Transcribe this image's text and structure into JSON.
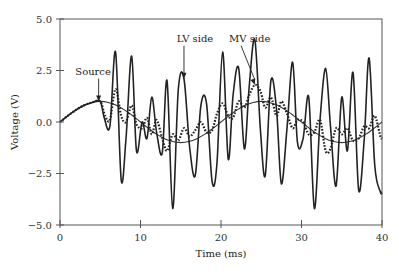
{
  "chart_data": {
    "type": "line",
    "title": "",
    "xlabel": "Time (ms)",
    "ylabel": "Voltage (V)",
    "xlim": [
      0,
      40
    ],
    "ylim": [
      -5.0,
      5.0
    ],
    "xticks": [
      0,
      10,
      20,
      30,
      40
    ],
    "xtick_labels": [
      "0",
      "10",
      "20",
      "30",
      "40"
    ],
    "yticks": [
      5.0,
      2.5,
      0.0,
      -2.5,
      -5.0
    ],
    "ytick_labels": [
      "5.0",
      "2.5",
      "0.0",
      "−2.5",
      "−5.0"
    ],
    "grid": false,
    "legend": "none (inline annotations)",
    "annotations": [
      {
        "text": "Source",
        "x_text": 1.9,
        "y_text": 2.3,
        "arrow_to": [
          4.8,
          1.0
        ]
      },
      {
        "text": "LV side",
        "x_text": 14.5,
        "y_text": 3.9,
        "arrow_to": [
          15.4,
          2.1
        ]
      },
      {
        "text": "MV side",
        "x_text": 21.0,
        "y_text": 3.9,
        "arrow_to": [
          24.2,
          1.8
        ]
      }
    ],
    "series": [
      {
        "name": "Source",
        "style": "solid-thin",
        "x": [
          0,
          1,
          2,
          3,
          4,
          5,
          6,
          7,
          8,
          9,
          10,
          11,
          12,
          13,
          14,
          15,
          16,
          17,
          18,
          19,
          20,
          21,
          22,
          23,
          24,
          25,
          26,
          27,
          28,
          29,
          30,
          31,
          32,
          33,
          34,
          35,
          36,
          37,
          38,
          39,
          40
        ],
        "values": [
          0.0,
          0.31,
          0.59,
          0.81,
          0.95,
          1.0,
          0.95,
          0.81,
          0.59,
          0.31,
          0.0,
          -0.31,
          -0.59,
          -0.81,
          -0.95,
          -1.0,
          -0.95,
          -0.81,
          -0.59,
          -0.31,
          0.0,
          0.31,
          0.59,
          0.81,
          0.95,
          1.0,
          0.95,
          0.81,
          0.59,
          0.31,
          0.0,
          -0.31,
          -0.59,
          -0.81,
          -0.95,
          -1.0,
          -0.95,
          -0.81,
          -0.59,
          -0.31,
          0.0
        ]
      },
      {
        "name": "LV side",
        "style": "solid-thick",
        "x": [
          0,
          1,
          2,
          3,
          4,
          5,
          5.5,
          6.2,
          6.9,
          7.6,
          8.2,
          8.9,
          9.5,
          10.2,
          10.8,
          11.4,
          12.0,
          12.7,
          13.3,
          14.0,
          14.7,
          15.4,
          16.1,
          16.8,
          17.5,
          18.2,
          18.9,
          19.5,
          20.2,
          20.9,
          21.5,
          22.2,
          22.9,
          23.5,
          24.2,
          24.9,
          25.5,
          26.2,
          26.9,
          27.5,
          28.2,
          28.9,
          29.5,
          30.2,
          30.9,
          31.6,
          32.3,
          33.0,
          33.6,
          34.3,
          35.0,
          35.7,
          36.4,
          37.1,
          37.8,
          38.4,
          39.1,
          39.8,
          40
        ],
        "values": [
          0.0,
          0.31,
          0.59,
          0.81,
          0.95,
          1.0,
          0.2,
          -0.2,
          3.4,
          -2.8,
          -0.8,
          3.2,
          -1.4,
          0.0,
          -0.8,
          1.2,
          -0.5,
          -1.5,
          2.0,
          -4.2,
          1.6,
          2.1,
          -1.2,
          -2.6,
          0.8,
          0.9,
          -2.9,
          -2.0,
          3.4,
          -1.8,
          1.3,
          2.6,
          -1.3,
          1.7,
          4.0,
          -0.4,
          -2.6,
          2.0,
          0.6,
          -3.0,
          -0.3,
          2.9,
          -1.0,
          -0.8,
          1.2,
          -4.2,
          0.1,
          2.6,
          -0.2,
          -3.1,
          1.2,
          -1.4,
          2.4,
          -3.3,
          -0.8,
          3.1,
          -2.1,
          -3.4,
          -3.4
        ]
      },
      {
        "name": "MV side",
        "style": "dotted",
        "x": [
          0,
          1,
          2,
          3,
          4,
          5,
          5.6,
          6.2,
          6.9,
          7.6,
          8.2,
          8.9,
          9.5,
          10.2,
          10.8,
          11.4,
          12.0,
          12.7,
          13.3,
          14.0,
          14.7,
          15.4,
          16.1,
          16.8,
          17.5,
          18.2,
          18.9,
          19.5,
          20.2,
          20.9,
          21.5,
          22.2,
          22.9,
          23.5,
          24.2,
          24.9,
          25.5,
          26.2,
          26.9,
          27.5,
          28.2,
          28.9,
          29.5,
          30.2,
          30.9,
          31.6,
          32.3,
          33.0,
          33.6,
          34.3,
          35.0,
          35.7,
          36.4,
          37.1,
          37.8,
          38.4,
          39.1,
          39.8,
          40
        ],
        "values": [
          0.0,
          0.31,
          0.59,
          0.81,
          0.95,
          1.0,
          0.3,
          0.1,
          1.6,
          0.3,
          0.0,
          0.8,
          -0.1,
          -0.3,
          0.2,
          -0.6,
          0.1,
          -0.8,
          -1.4,
          -0.6,
          -0.9,
          -0.3,
          -0.7,
          -0.4,
          0.0,
          -0.5,
          -0.4,
          0.4,
          0.9,
          0.3,
          0.2,
          1.0,
          0.7,
          1.3,
          1.8,
          1.5,
          0.7,
          1.2,
          0.3,
          1.0,
          0.4,
          -0.3,
          0.1,
          0.0,
          -0.6,
          -0.5,
          0.1,
          -1.4,
          -1.3,
          -0.3,
          -0.6,
          -0.3,
          -0.9,
          -0.8,
          -0.2,
          -0.3,
          0.3,
          -0.7,
          -0.8
        ]
      }
    ]
  }
}
